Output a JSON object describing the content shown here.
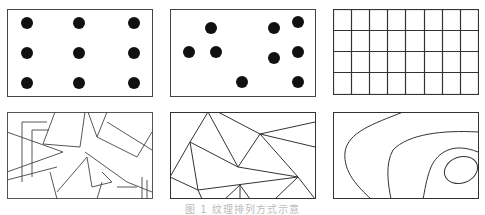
{
  "figure": {
    "caption": "图 1 纹理排列方式示意",
    "stroke_color": "#333333",
    "dot_color": "#111111",
    "panels": [
      {
        "id": "regular-dots",
        "label": "规则点阵"
      },
      {
        "id": "random-dots",
        "label": "随机点"
      },
      {
        "id": "grid",
        "label": "网格",
        "rows": 4,
        "cols": 8
      },
      {
        "id": "overlapping-polygons",
        "label": "重叠多边形"
      },
      {
        "id": "triangulation",
        "label": "三角剖分"
      },
      {
        "id": "contours",
        "label": "等值线"
      }
    ]
  }
}
